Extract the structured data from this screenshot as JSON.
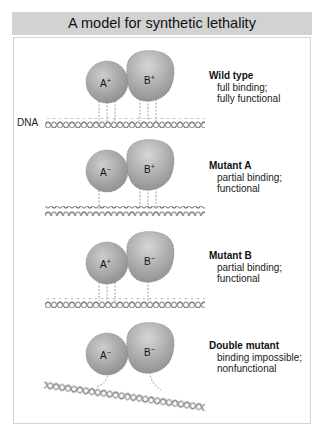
{
  "header": {
    "title": "A model for synthetic lethality"
  },
  "dna_label": "DNA",
  "cases": [
    {
      "title": "Wild type",
      "desc": [
        "full binding;",
        "fully functional"
      ],
      "a_label": "A",
      "a_sup": "+",
      "b_label": "B",
      "b_sup": "+",
      "a_contacts": 3,
      "b_contacts": 3,
      "bound": true
    },
    {
      "title": "Mutant A",
      "desc": [
        "partial binding;",
        "functional"
      ],
      "a_label": "A",
      "a_sup": "−",
      "b_label": "B",
      "b_sup": "+",
      "a_contacts": 1,
      "b_contacts": 3,
      "bound": true
    },
    {
      "title": "Mutant B",
      "desc": [
        "partial binding;",
        "functional"
      ],
      "a_label": "A",
      "a_sup": "+",
      "b_label": "B",
      "b_sup": "−",
      "a_contacts": 3,
      "b_contacts": 1,
      "bound": true
    },
    {
      "title": "Double mutant",
      "desc": [
        "binding impossible;",
        "nonfunctional"
      ],
      "a_label": "A",
      "a_sup": "−",
      "b_label": "B",
      "b_sup": "−",
      "a_contacts": 1,
      "b_contacts": 1,
      "bound": false
    }
  ],
  "colors": {
    "header_bg": "#d2d2d2",
    "protein_fill": "#a9a9a9",
    "protein_highlight": "#cfcfcf",
    "protein_edge": "#7a7a7a",
    "dna_strand": "#8a8a8a",
    "contact_line": "#888888"
  }
}
